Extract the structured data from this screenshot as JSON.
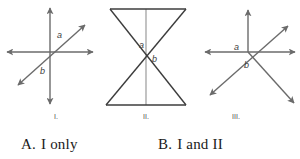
{
  "question": {
    "figures": [
      {
        "id": "figure-1",
        "caption": "I.",
        "angle_labels": [
          "a",
          "b"
        ],
        "description": "Three lines intersecting at one point: vertical double arrow, horizontal double arrow, and a diagonal double arrow from lower-left to upper-right"
      },
      {
        "id": "figure-2",
        "caption": "II.",
        "angle_labels": [
          "a",
          "b"
        ],
        "description": "Bowtie / hourglass: two triangles meeting at a vertex with a vertical segment through the middle"
      },
      {
        "id": "figure-3",
        "caption": "III.",
        "angle_labels": [
          "a",
          "b"
        ],
        "description": "Rays from a common point: vertical ray up, horizontal double arrow, and two diagonal double arrows"
      }
    ],
    "choices": [
      {
        "letter": "A.",
        "text": "I only"
      },
      {
        "letter": "B.",
        "text": "I and II"
      }
    ]
  },
  "style": {
    "line_color": "#6b6b6b",
    "heavy_line_color": "#3c3c3c",
    "label_color": "#4a4a4a",
    "text_color": "#1a1a1a",
    "background": "#ffffff"
  }
}
